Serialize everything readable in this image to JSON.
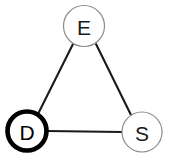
{
  "diagram": {
    "background_color": "#ffffff",
    "nodes": [
      {
        "id": "E",
        "label": "E",
        "cx": 84,
        "cy": 26,
        "r": 20.5,
        "highlighted": false,
        "stroke_color": "#8c8c8c",
        "fill_color": "#ffffff",
        "label_color": "#1a1a1a"
      },
      {
        "id": "D",
        "label": "D",
        "cx": 27,
        "cy": 131,
        "r": 19.5,
        "highlighted": true,
        "stroke_color": "#000000",
        "fill_color": "#ffffff",
        "label_color": "#000000"
      },
      {
        "id": "S",
        "label": "S",
        "cx": 142,
        "cy": 132,
        "r": 20.0,
        "highlighted": false,
        "stroke_color": "#8c8c8c",
        "fill_color": "#ffffff",
        "label_color": "#1a1a1a"
      }
    ],
    "edges": [
      {
        "id": "edge-e-d",
        "from": "E",
        "to": "D",
        "x1": 73,
        "y1": 44,
        "x2": 38,
        "y2": 114,
        "color": "#1a1a1a"
      },
      {
        "id": "edge-e-s",
        "from": "E",
        "to": "S",
        "x1": 96,
        "y1": 44,
        "x2": 131,
        "y2": 115,
        "color": "#1a1a1a"
      },
      {
        "id": "edge-d-s",
        "from": "D",
        "to": "S",
        "x1": 47,
        "y1": 131,
        "x2": 122,
        "y2": 132,
        "color": "#1a1a1a"
      }
    ]
  }
}
